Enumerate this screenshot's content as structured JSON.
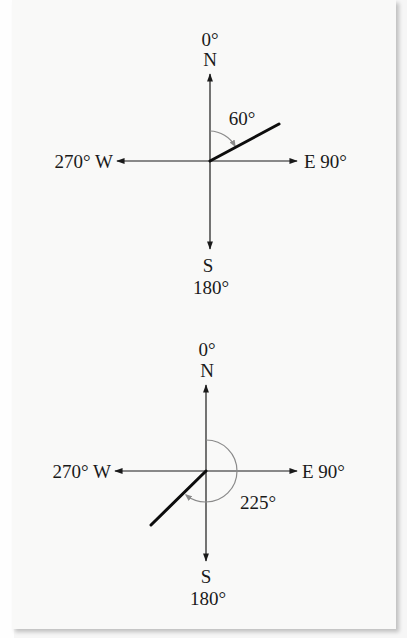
{
  "figures": [
    {
      "id": "compass-60",
      "center": {
        "x": 210,
        "y": 161
      },
      "north": {
        "label": "N",
        "degree": "0°"
      },
      "east": {
        "label": "E",
        "degree": "90°",
        "text": "E 90°"
      },
      "south": {
        "label": "S",
        "degree": "180°"
      },
      "west": {
        "label": "W",
        "degree": "270°",
        "text": "270° W"
      },
      "bearing": {
        "value": 60,
        "label": "60°"
      }
    },
    {
      "id": "compass-225",
      "center": {
        "x": 206,
        "y": 471
      },
      "north": {
        "label": "N",
        "degree": "0°"
      },
      "east": {
        "label": "E",
        "degree": "90°",
        "text": "E 90°"
      },
      "south": {
        "label": "S",
        "degree": "180°"
      },
      "west": {
        "label": "W",
        "degree": "270°",
        "text": "270° W"
      },
      "bearing": {
        "value": 225,
        "label": "225°"
      }
    }
  ],
  "colors": {
    "axis": "#1a1a1a",
    "bearing_ray": "#0d0d0d",
    "angle_arc": "#8a8a8a",
    "paper": "#f9f9f8"
  }
}
